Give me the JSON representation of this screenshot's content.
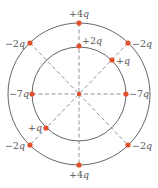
{
  "diagram": {
    "type": "charge-arrangement",
    "center": {
      "x": 79,
      "y": 94
    },
    "circles": [
      {
        "name": "outer-circle",
        "r": 71
      },
      {
        "name": "inner-circle",
        "r": 47
      }
    ],
    "colors": {
      "circle": "#666666",
      "dash": "#888888",
      "charge": "#e0502a",
      "label": "#555555"
    },
    "charges": [
      {
        "id": "outer-top",
        "label": "+4q",
        "x": 79,
        "y": 23,
        "lx": 79,
        "ly": 17,
        "anchor": "middle"
      },
      {
        "id": "outer-bottom",
        "label": "+4q",
        "x": 79,
        "y": 165,
        "lx": 79,
        "ly": 178,
        "anchor": "middle"
      },
      {
        "id": "outer-upper-left",
        "label": "−2q",
        "x": 30,
        "y": 43,
        "lx": 25,
        "ly": 47,
        "anchor": "end"
      },
      {
        "id": "outer-upper-right",
        "label": "−2q",
        "x": 128,
        "y": 43,
        "lx": 132,
        "ly": 47,
        "anchor": "start"
      },
      {
        "id": "outer-lower-left",
        "label": "−2q",
        "x": 30,
        "y": 145,
        "lx": 25,
        "ly": 149,
        "anchor": "end"
      },
      {
        "id": "outer-lower-right",
        "label": "−2q",
        "x": 128,
        "y": 145,
        "lx": 132,
        "ly": 149,
        "anchor": "start"
      },
      {
        "id": "inner-top",
        "label": "+2q",
        "x": 79,
        "y": 46,
        "lx": 82,
        "ly": 44,
        "anchor": "start"
      },
      {
        "id": "inner-upper-right",
        "label": "+q",
        "x": 112,
        "y": 60,
        "lx": 116,
        "ly": 64,
        "anchor": "start"
      },
      {
        "id": "inner-lower-left",
        "label": "+q",
        "x": 46,
        "y": 128,
        "lx": 42,
        "ly": 131,
        "anchor": "end"
      },
      {
        "id": "inner-left",
        "label": "−7q",
        "x": 32,
        "y": 94,
        "lx": 29,
        "ly": 97,
        "anchor": "end"
      },
      {
        "id": "inner-right",
        "label": "−7q",
        "x": 126,
        "y": 94,
        "lx": 129,
        "ly": 97,
        "anchor": "start"
      }
    ],
    "dashed_lines": [
      {
        "name": "vertical-line",
        "x1": 79,
        "y1": 23,
        "x2": 79,
        "y2": 165
      },
      {
        "name": "horizontal-line",
        "x1": 32,
        "y1": 94,
        "x2": 126,
        "y2": 94
      },
      {
        "name": "diagonal-line-a",
        "x1": 30,
        "y1": 43,
        "x2": 79,
        "y2": 94
      },
      {
        "name": "diagonal-line-b",
        "x1": 79,
        "y1": 94,
        "x2": 128,
        "y2": 145
      },
      {
        "name": "diagonal-line-c",
        "x1": 128,
        "y1": 43,
        "x2": 30,
        "y2": 145
      }
    ]
  }
}
